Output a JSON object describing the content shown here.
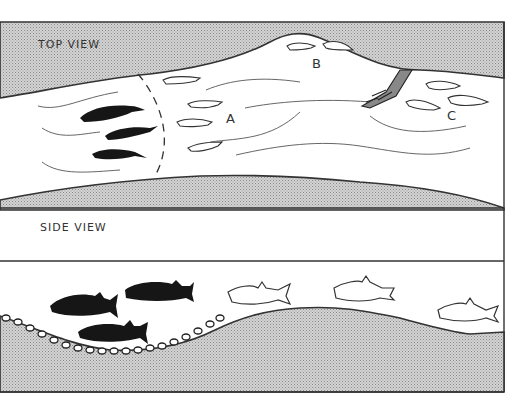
{
  "diagram": {
    "panels": [
      {
        "id": "top",
        "label": "TOP VIEW",
        "zones": [
          {
            "marker": "A",
            "description": "small fish in current just past the dashed line",
            "fish_count": 4
          },
          {
            "marker": "B",
            "description": "small fish along the upper bank bulge",
            "fish_count": 2
          },
          {
            "marker": "C",
            "description": "small fish below the fallen branch / root",
            "fish_count": 3
          }
        ],
        "dark_fish_count": 3,
        "features": [
          "dashed dividing line",
          "current lines",
          "fallen branch"
        ]
      },
      {
        "id": "side",
        "label": "SIDE VIEW",
        "dark_fish_count": 3,
        "outline_fish_count": 4,
        "features": [
          "gravel bed in depression",
          "stream bed profile"
        ]
      }
    ],
    "colors": {
      "ink": "#222222",
      "dark_fish": "#161616",
      "bank_fill": "#c8c8c8",
      "water": "#ffffff"
    }
  }
}
